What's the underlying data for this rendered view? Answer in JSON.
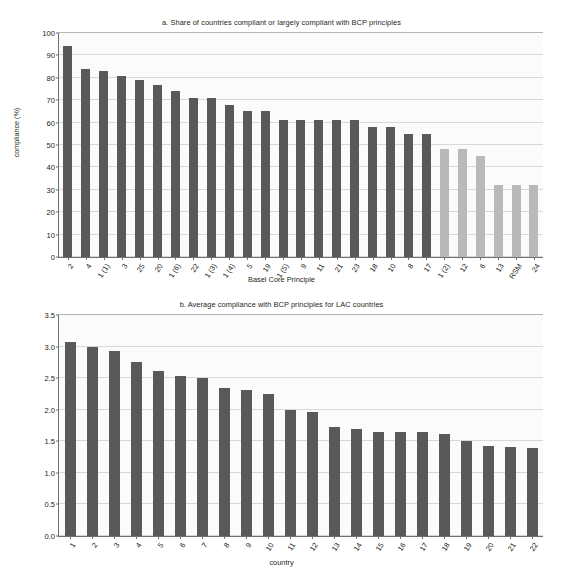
{
  "chart_data": [
    {
      "type": "bar",
      "panel": "a",
      "title": "a. Share of countries compliant or largely compliant with BCP principles",
      "xlabel": "Basel Core Principle",
      "ylabel": "compliance (%)",
      "ylim": [
        0,
        100
      ],
      "yticks": [
        0,
        10,
        20,
        30,
        40,
        50,
        60,
        70,
        80,
        90,
        100
      ],
      "grid": true,
      "legend": "none",
      "categories": [
        "2",
        "4",
        "1 (1)",
        "3",
        "25",
        "20",
        "1 (6)",
        "22",
        "1 (3)",
        "1 (4)",
        "5",
        "19",
        "1 (5)",
        "9",
        "11",
        "21",
        "23",
        "18",
        "10",
        "8",
        "17",
        "1 (2)",
        "12",
        "6",
        "13",
        "RSM",
        "24"
      ],
      "values": [
        94,
        84,
        83,
        81,
        79,
        77,
        74,
        71,
        71,
        68,
        65,
        65,
        61,
        61,
        61,
        61,
        61,
        58,
        58,
        55,
        55,
        48,
        48,
        45,
        32,
        32,
        32
      ],
      "bar_colors": [
        "dark",
        "dark",
        "dark",
        "dark",
        "dark",
        "dark",
        "dark",
        "dark",
        "dark",
        "dark",
        "dark",
        "dark",
        "dark",
        "dark",
        "dark",
        "dark",
        "dark",
        "dark",
        "dark",
        "dark",
        "dark",
        "light",
        "light",
        "light",
        "light",
        "light",
        "light"
      ]
    },
    {
      "type": "bar",
      "panel": "b",
      "title": "b. Average compliance with BCP principles for LAC countries",
      "xlabel": "country",
      "ylabel": "",
      "ylim": [
        0,
        3.5
      ],
      "yticks": [
        "0.0",
        "0.5",
        "1.0",
        "1.5",
        "2.0",
        "2.5",
        "3.0",
        "3.5"
      ],
      "grid": true,
      "legend": "none",
      "categories": [
        "1",
        "2",
        "3",
        "4",
        "5",
        "6",
        "7",
        "8",
        "9",
        "10",
        "11",
        "12",
        "13",
        "14",
        "15",
        "16",
        "17",
        "18",
        "19",
        "20",
        "21",
        "22"
      ],
      "values": [
        3.08,
        3.0,
        2.93,
        2.75,
        2.61,
        2.53,
        2.5,
        2.35,
        2.32,
        2.25,
        2.0,
        1.96,
        1.72,
        1.69,
        1.64,
        1.64,
        1.64,
        1.62,
        1.51,
        1.43,
        1.41,
        1.39
      ],
      "bar_colors": [
        "dark",
        "dark",
        "dark",
        "dark",
        "dark",
        "dark",
        "dark",
        "dark",
        "dark",
        "dark",
        "dark",
        "dark",
        "dark",
        "dark",
        "dark",
        "dark",
        "dark",
        "dark",
        "dark",
        "dark",
        "dark",
        "dark"
      ]
    }
  ],
  "colors": {
    "bar_dark": "#595959",
    "bar_light": "#b9b9b9",
    "grid": "#d8d8d8",
    "axis": "#6f6f6f",
    "text": "#231f20",
    "plot_background": "#fbfbfb",
    "page_background": "#ffffff"
  }
}
